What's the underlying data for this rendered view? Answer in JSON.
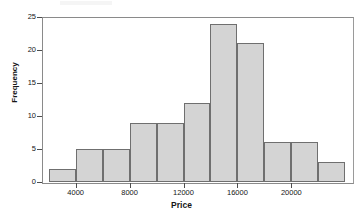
{
  "chart_data": {
    "type": "bar",
    "title": "",
    "subtitle": "",
    "xlabel": "Price",
    "ylabel": "Frequency",
    "categories": [
      "2000-4000",
      "4000-6000",
      "6000-8000",
      "8000-10000",
      "10000-12000",
      "12000-14000",
      "14000-16000",
      "16000-18000",
      "18000-20000",
      "20000-22000",
      "22000-24000"
    ],
    "bin_edges": [
      2000,
      4000,
      6000,
      8000,
      10000,
      12000,
      14000,
      16000,
      18000,
      20000,
      22000,
      24000
    ],
    "values": [
      2,
      5,
      5,
      9,
      9,
      12,
      24,
      21,
      6,
      6,
      3
    ],
    "xlim": [
      1500,
      24500
    ],
    "ylim": [
      0,
      25
    ],
    "x_ticks": [
      4000,
      8000,
      12000,
      16000,
      20000
    ],
    "x_tick_labels": [
      "4000",
      "8000",
      "12000",
      "16000",
      "20000"
    ],
    "y_ticks": [
      0,
      5,
      10,
      15,
      20,
      25
    ],
    "y_tick_labels": [
      "0",
      "5",
      "10",
      "15",
      "20",
      "25"
    ],
    "grid": false,
    "legend": false,
    "bar_fill_color": "#d4d4d4",
    "bar_edge_color": "#6f6f6f",
    "axis_color": "#8a8a8a",
    "text_color": "#161616"
  }
}
